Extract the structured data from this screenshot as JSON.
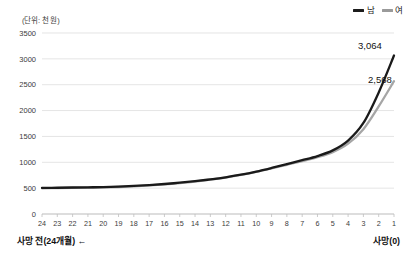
{
  "unit_note": "(단위: 천 원)",
  "legend": {
    "position": "top-right",
    "entries": [
      {
        "label": "남",
        "color": "#1a1a1a"
      },
      {
        "label": "여",
        "color": "#a6a6a6"
      }
    ]
  },
  "footer": {
    "left": "사망 전(24개월) ←",
    "right": "사망(0)"
  },
  "chart_data": {
    "type": "line",
    "title": "",
    "subtitle": "",
    "xlabel": "",
    "ylabel": "",
    "unit": "(단위: 천 원)",
    "grid": true,
    "legend_position": "top-right",
    "ylim": [
      0,
      3500
    ],
    "yticks": [
      0,
      500,
      1000,
      1500,
      2000,
      2500,
      3000,
      3500
    ],
    "ytick_labels": [
      "0",
      "500",
      "1000",
      "1500",
      "2000",
      "2500",
      "3000",
      "3500"
    ],
    "x_order": "descending",
    "categories": [
      24,
      23,
      22,
      21,
      20,
      19,
      18,
      17,
      16,
      15,
      14,
      13,
      12,
      11,
      10,
      9,
      8,
      7,
      6,
      5,
      4,
      3,
      2,
      1
    ],
    "xtick_labels": [
      "24",
      "23",
      "22",
      "21",
      "20",
      "19",
      "18",
      "17",
      "16",
      "15",
      "14",
      "13",
      "12",
      "11",
      "10",
      "9",
      "8",
      "7",
      "6",
      "5",
      "4",
      "3",
      "2",
      "1"
    ],
    "series": [
      {
        "name": "남",
        "color": "#1a1a1a",
        "values": [
          505,
          508,
          512,
          516,
          520,
          530,
          545,
          560,
          580,
          605,
          635,
          670,
          710,
          760,
          820,
          890,
          965,
          1040,
          1120,
          1230,
          1420,
          1760,
          2350,
          3064
        ],
        "end_label": "3,064"
      },
      {
        "name": "여",
        "color": "#a6a6a6",
        "values": [
          498,
          500,
          504,
          508,
          513,
          522,
          536,
          552,
          572,
          598,
          628,
          664,
          706,
          756,
          816,
          882,
          952,
          1022,
          1098,
          1196,
          1360,
          1640,
          2080,
          2568
        ],
        "end_label": "2,568"
      }
    ],
    "annotations": [
      {
        "text": "3,064",
        "series": "남",
        "at_x": 1
      },
      {
        "text": "2,568",
        "series": "여",
        "at_x": 1
      }
    ]
  }
}
